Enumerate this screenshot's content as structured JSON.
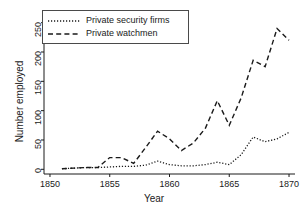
{
  "chart_data": {
    "type": "line",
    "title": "",
    "xlabel": "Year",
    "ylabel": "Number employed",
    "xlim": [
      1849.5,
      1870.5
    ],
    "ylim": [
      -8,
      258
    ],
    "xticks": [
      1850,
      1855,
      1860,
      1865,
      1870
    ],
    "yticks": [
      0,
      50,
      100,
      150,
      200,
      250
    ],
    "grid": false,
    "legend_position": "upper left",
    "x": [
      1851,
      1852,
      1853,
      1854,
      1855,
      1856,
      1857,
      1858,
      1859,
      1860,
      1861,
      1862,
      1863,
      1864,
      1865,
      1866,
      1867,
      1868,
      1869,
      1870
    ],
    "series": [
      {
        "name": "Private security firms",
        "style": "dotted",
        "color": "#1a1a1a",
        "values": [
          1,
          2,
          3,
          3,
          4,
          5,
          5,
          7,
          14,
          8,
          6,
          6,
          8,
          12,
          8,
          25,
          55,
          47,
          52,
          63
        ]
      },
      {
        "name": "Private watchmen",
        "style": "dashed",
        "color": "#1a1a1a",
        "values": [
          1,
          2,
          3,
          3,
          20,
          20,
          10,
          37,
          65,
          52,
          32,
          45,
          70,
          117,
          75,
          122,
          186,
          175,
          240,
          220
        ]
      }
    ]
  },
  "legend": {
    "entries": [
      {
        "label": "Private security firms",
        "key": "dotted-line-key"
      },
      {
        "label": "Private watchmen",
        "key": "dashed-line-key"
      }
    ]
  },
  "axes": {
    "x_tick_labels": [
      "1850",
      "1855",
      "1860",
      "1865",
      "1870"
    ],
    "y_tick_labels": [
      "0",
      "50",
      "100",
      "150",
      "200",
      "250"
    ],
    "x_title": "Year",
    "y_title": "Number employed"
  },
  "colors": {
    "axis": "#1a1a1a",
    "series": "#1a1a1a",
    "background": "#ffffff",
    "legend_border": "#4a4a4a"
  }
}
